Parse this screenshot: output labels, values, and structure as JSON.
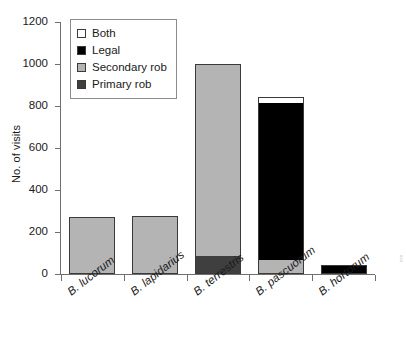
{
  "chart_data": {
    "type": "bar",
    "stacked": true,
    "title": "",
    "xlabel": "",
    "ylabel": "No. of visits",
    "ylim": [
      0,
      1200
    ],
    "yticks": [
      0,
      200,
      400,
      600,
      800,
      1000,
      1200
    ],
    "grid": false,
    "legend_position": "top-left",
    "categories": [
      "B. lucorum",
      "B. lapidarius",
      "B. terrestris",
      "B. pascuorum",
      "B. hortorum"
    ],
    "series": [
      {
        "name": "Primary rob",
        "color": "#3f3f3f",
        "values": [
          0,
          0,
          85,
          0,
          0
        ]
      },
      {
        "name": "Secondary rob",
        "color": "#b4b4b4",
        "values": [
          270,
          278,
          915,
          65,
          0
        ]
      },
      {
        "name": "Legal",
        "color": "#000000",
        "values": [
          0,
          0,
          0,
          750,
          45
        ]
      },
      {
        "name": "Both",
        "color": "#ffffff",
        "values": [
          0,
          0,
          0,
          30,
          0
        ]
      }
    ],
    "totals": [
      270,
      278,
      1000,
      845,
      45
    ]
  },
  "axes": {
    "y_title": "No. of visits",
    "y_tick_labels": [
      "1200",
      "1000",
      "800",
      "600",
      "400",
      "200",
      "0"
    ]
  },
  "legend": {
    "items": [
      {
        "label": "Both",
        "color": "#ffffff"
      },
      {
        "label": "Legal",
        "color": "#000000"
      },
      {
        "label": "Secondary rob",
        "color": "#b4b4b4"
      },
      {
        "label": "Primary rob",
        "color": "#3f3f3f"
      }
    ]
  },
  "colors": {
    "axis": "#6f6f6f",
    "text": "#1a1a1a",
    "bar_outline": "#3a3a3a",
    "background": "#ffffff"
  },
  "margin_note": "iiiiii"
}
